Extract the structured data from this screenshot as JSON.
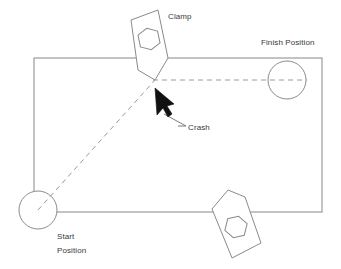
{
  "diagram": {
    "background_color": "#ffffff",
    "line_color": "#777777",
    "dash_color": "#8a8a8a",
    "arrow_color": "#000000",
    "text_color": "#3a3a3a",
    "labels": {
      "clamp": "Clamp",
      "finish_position": "Finish Position",
      "crash": "Crash",
      "start_position_line1": "Start",
      "start_position_line2": "Position"
    },
    "shapes": {
      "work_rectangle": {
        "name": "work-envelope-rectangle",
        "left": 34,
        "top": 58,
        "right": 322,
        "bottom": 212
      },
      "start_circle": {
        "cx": 38,
        "cy": 210,
        "r": 19
      },
      "finish_circle": {
        "cx": 287,
        "cy": 80,
        "r": 19
      },
      "top_clamp": {
        "outline": "131,20 158,10 168,58 155,80 138,70",
        "nut_center": {
          "cx": 149,
          "cy": 39,
          "r": 11
        }
      },
      "bottom_clamp": {
        "outline": "228,190 244,196 260,243 232,258 212,208",
        "nut_center": {
          "cx": 236,
          "cy": 227,
          "r": 11
        }
      },
      "dashed_horizontal": {
        "x1": 155,
        "y1": 80,
        "x2": 306,
        "y2": 80
      },
      "dashed_diagonal": {
        "x1": 38,
        "y1": 210,
        "x2": 155,
        "y2": 80
      },
      "crash_leader": {
        "x1": 165,
        "y1": 115,
        "x2": 185,
        "y2": 126
      },
      "crash_arrow_tip": {
        "x": 155,
        "y": 88
      }
    }
  }
}
